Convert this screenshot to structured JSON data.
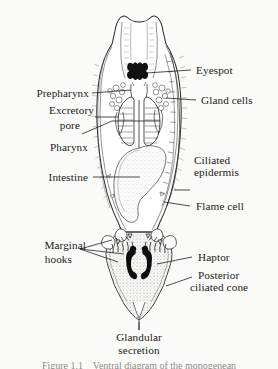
{
  "figure": {
    "background_color": "#fbfbf9",
    "ink_color": "#1a1a1a",
    "stipple_color": "#9b9b96",
    "organism_view": "ventral"
  },
  "labels": {
    "eyespot": "Eyespot",
    "gland_cells": "Gland cells",
    "ciliated_epidermis_line1": "Ciliated",
    "ciliated_epidermis_line2": "epidermis",
    "flame_cell": "Flame cell",
    "haptor": "Haptor",
    "posterior_cone_line1": "Posterior",
    "posterior_cone_line2": "ciliated cone",
    "prepharynx": "Prepharynx",
    "excretory_pore_line1": "Excretory",
    "excretory_pore_line2": "pore",
    "pharynx": "Pharynx",
    "intestine": "Intestine",
    "marginal_hooks_line1": "Marginal",
    "marginal_hooks_line2": "hooks",
    "glandular_secretion_line1": "Glandular",
    "glandular_secretion_line2": "secretion"
  },
  "caption": {
    "text": "Figure 1.1    Ventral diagram of the monogenean",
    "clipped": true
  }
}
